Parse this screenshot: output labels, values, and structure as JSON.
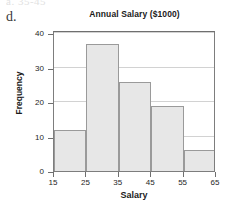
{
  "page": {
    "top_cutoff_text": "a. 35-45",
    "part_label": "d."
  },
  "chart_data": {
    "type": "bar",
    "title": "Annual Salary ($1000)",
    "xlabel": "Salary",
    "ylabel": "Frequency",
    "bin_edges": [
      15,
      25,
      35,
      45,
      55,
      65
    ],
    "categories": [
      "15-25",
      "25-35",
      "35-45",
      "45-55",
      "55-65"
    ],
    "values": [
      12,
      37,
      26,
      19,
      6
    ],
    "xlim": [
      15,
      65
    ],
    "ylim": [
      0,
      41
    ],
    "xticks": [
      15,
      25,
      35,
      45,
      55,
      65
    ],
    "yticks": [
      0,
      10,
      20,
      30,
      40
    ],
    "xtick_labels": [
      "15",
      "25",
      "35",
      "45",
      "55",
      "65"
    ],
    "ytick_labels": [
      "0",
      "10",
      "20",
      "30",
      "40"
    ],
    "grid": "horizontal",
    "legend": "none",
    "bar_fill_color": "#e7e7e7",
    "bar_edge_color": "#9a9a9a",
    "gridline_color": "#d2d2d2",
    "axis_color": "#6f6f6f"
  }
}
